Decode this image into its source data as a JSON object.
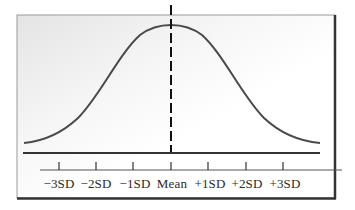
{
  "diagram": {
    "type": "normal-distribution-bell-curve",
    "center_marker": "dashed vertical line at Mean",
    "axis_labels": [
      "−3SD",
      "−2SD",
      "−1SD",
      "Mean",
      "+1SD",
      "+2SD",
      "+3SD"
    ],
    "tick_positions_px": [
      59,
      96,
      133,
      171,
      208,
      246,
      283
    ],
    "colors": {
      "curve": "#4a4a4a",
      "axis": "#3a3a3a",
      "frame": "#333333",
      "dashed_line": "#111111",
      "background": "#ffffff",
      "panel_shade": "#e6e6e6"
    }
  }
}
